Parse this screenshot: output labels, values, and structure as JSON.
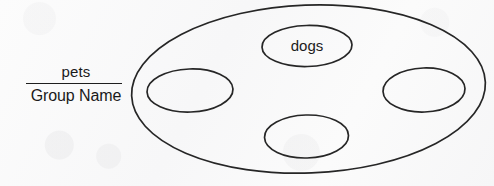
{
  "worksheet": {
    "caption": {
      "numerator": "pets",
      "denominator": "Group Name"
    },
    "diagram": {
      "outer_group": {
        "label": "",
        "member_labels": [
          "dogs",
          "",
          "",
          ""
        ]
      },
      "items": [
        {
          "name": "top-member-ellipse",
          "label": "dogs"
        },
        {
          "name": "left-member-ellipse",
          "label": ""
        },
        {
          "name": "right-member-ellipse",
          "label": ""
        },
        {
          "name": "bottom-member-ellipse",
          "label": ""
        }
      ]
    },
    "colors": {
      "ink": "#262626",
      "paper": "#f9f9f9"
    }
  }
}
